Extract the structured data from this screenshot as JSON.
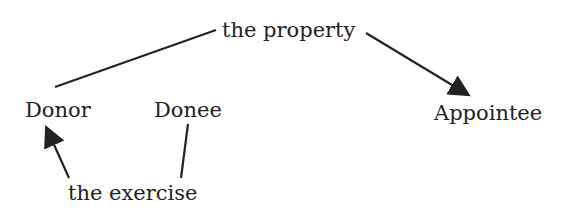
{
  "diagram": {
    "nodes": {
      "property": {
        "label": "the property"
      },
      "donor": {
        "label": "Donor"
      },
      "donee": {
        "label": "Donee"
      },
      "appointee": {
        "label": "Appointee"
      },
      "exercise": {
        "label": "the exercise"
      }
    },
    "edges": [
      {
        "from": "property",
        "to": "donor",
        "arrow": false
      },
      {
        "from": "property",
        "to": "appointee",
        "arrow": true
      },
      {
        "from": "exercise",
        "to": "donor",
        "arrow": true
      },
      {
        "from": "exercise",
        "to": "donee",
        "arrow": false
      }
    ],
    "colors": {
      "ink": "#222222",
      "background": "#ffffff"
    }
  }
}
